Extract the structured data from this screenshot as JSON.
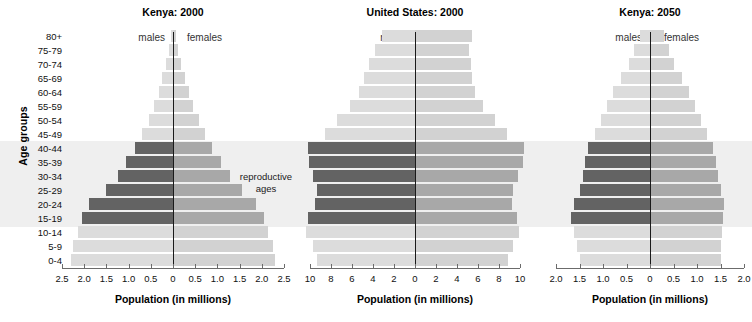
{
  "figure": {
    "y_axis_title": "Age groups",
    "reproductive_note_line1": "reproductive",
    "reproductive_note_line2": "ages",
    "male_label": "males",
    "female_label": "females",
    "x_axis_title": "Population (in millions)"
  },
  "colors": {
    "male_repro": "#636363",
    "female_repro": "#a8a8a8",
    "male_other": "#dcdcdc",
    "female_other": "#d2d2d2",
    "band": "#efefef",
    "axis": "#6b6b6b",
    "center_line": "#1a1a1a",
    "text": "#111111"
  },
  "age_groups": [
    "80+",
    "75-79",
    "70-74",
    "65-69",
    "60-64",
    "55-59",
    "50-54",
    "45-49",
    "40-44",
    "35-39",
    "30-34",
    "25-29",
    "20-24",
    "15-19",
    "10-14",
    "5-9",
    "0-4"
  ],
  "reproductive_groups": [
    "15-19",
    "20-24",
    "25-29",
    "30-34",
    "35-39",
    "40-44"
  ],
  "chart_data": [
    {
      "type": "bar",
      "title": "Kenya:  2000",
      "subtype": "population-pyramid",
      "xlabel": "Population (in millions)",
      "ylabel": "Age groups",
      "xlim": [
        -2.5,
        2.5
      ],
      "xticks": [
        2.5,
        2.0,
        1.5,
        1.0,
        0.5,
        0,
        0.5,
        1.0,
        1.5,
        2.0,
        2.5
      ],
      "xticklabels": [
        "2.5",
        "2.0",
        "1.5",
        "1.0",
        "0.5",
        "0",
        "0.5",
        "1.0",
        "1.5",
        "2.0",
        "2.5"
      ],
      "categories": [
        "80+",
        "75-79",
        "70-74",
        "65-69",
        "60-64",
        "55-59",
        "50-54",
        "45-49",
        "40-44",
        "35-39",
        "30-34",
        "25-29",
        "20-24",
        "15-19",
        "10-14",
        "5-9",
        "0-4"
      ],
      "series": [
        {
          "name": "males",
          "values": [
            0.05,
            0.1,
            0.16,
            0.24,
            0.32,
            0.42,
            0.55,
            0.7,
            0.86,
            1.05,
            1.25,
            1.5,
            1.9,
            2.05,
            2.15,
            2.25,
            2.3
          ]
        },
        {
          "name": "females",
          "values": [
            0.07,
            0.12,
            0.18,
            0.26,
            0.35,
            0.45,
            0.58,
            0.72,
            0.88,
            1.08,
            1.28,
            1.55,
            1.88,
            2.05,
            2.15,
            2.25,
            2.3
          ]
        }
      ],
      "grid": false,
      "legend": "inline"
    },
    {
      "type": "bar",
      "title": "United States:  2000",
      "subtype": "population-pyramid",
      "xlabel": "Population (in millions)",
      "ylabel": "Age groups",
      "xlim": [
        -10,
        10
      ],
      "xticks": [
        10,
        8,
        6,
        4,
        2,
        0,
        2,
        4,
        6,
        8,
        10
      ],
      "xticklabels": [
        "10",
        "8",
        "6",
        "4",
        "2",
        "0",
        "2",
        "4",
        "6",
        "8",
        "10"
      ],
      "categories": [
        "80+",
        "75-79",
        "70-74",
        "65-69",
        "60-64",
        "55-59",
        "50-54",
        "45-49",
        "40-44",
        "35-39",
        "30-34",
        "25-29",
        "20-24",
        "15-19",
        "10-14",
        "5-9",
        "0-4"
      ],
      "series": [
        {
          "name": "males",
          "values": [
            3.1,
            3.8,
            4.4,
            4.9,
            5.3,
            6.2,
            7.4,
            8.6,
            10.2,
            10.1,
            9.7,
            9.3,
            9.5,
            10.2,
            10.4,
            9.7,
            9.3
          ]
        },
        {
          "name": "females",
          "values": [
            5.4,
            5.1,
            5.3,
            5.4,
            5.7,
            6.5,
            7.6,
            8.8,
            10.4,
            10.3,
            9.8,
            9.3,
            9.2,
            9.7,
            9.9,
            9.3,
            8.9
          ]
        }
      ],
      "grid": false,
      "legend": "inline"
    },
    {
      "type": "bar",
      "title": "Kenya:  2050",
      "subtype": "population-pyramid",
      "xlabel": "Population (in millions)",
      "ylabel": "Age groups",
      "xlim": [
        -2.0,
        2.0
      ],
      "xticks": [
        2.0,
        1.5,
        1.0,
        0.5,
        0,
        0.5,
        1.0,
        1.5,
        2.0
      ],
      "xticklabels": [
        "2.0",
        "1.5",
        "1.0",
        "0.5",
        "0",
        "0.5",
        "1.0",
        "1.5",
        "2.0"
      ],
      "categories": [
        "80+",
        "75-79",
        "70-74",
        "65-69",
        "60-64",
        "55-59",
        "50-54",
        "45-49",
        "40-44",
        "35-39",
        "30-34",
        "25-29",
        "20-24",
        "15-19",
        "10-14",
        "5-9",
        "0-4"
      ],
      "series": [
        {
          "name": "males",
          "values": [
            0.22,
            0.33,
            0.45,
            0.62,
            0.78,
            0.92,
            1.05,
            1.18,
            1.32,
            1.38,
            1.42,
            1.48,
            1.62,
            1.68,
            1.62,
            1.56,
            1.5
          ]
        },
        {
          "name": "females",
          "values": [
            0.3,
            0.4,
            0.52,
            0.68,
            0.82,
            0.95,
            1.08,
            1.22,
            1.35,
            1.4,
            1.45,
            1.52,
            1.58,
            1.56,
            1.54,
            1.52,
            1.5
          ]
        }
      ],
      "grid": false,
      "legend": "inline"
    }
  ],
  "panels_geometry": [
    {
      "left": 62,
      "width": 222,
      "center_frac": 0.5
    },
    {
      "left": 310,
      "width": 210,
      "center_frac": 0.5
    },
    {
      "left": 556,
      "width": 188,
      "center_frac": 0.5
    }
  ]
}
